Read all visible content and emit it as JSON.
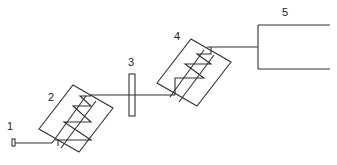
{
  "diagram": {
    "type": "optical-setup schematic",
    "labels": {
      "source": "1",
      "first_block": "2",
      "plate": "3",
      "second_block": "4",
      "output": "5"
    },
    "colors": {
      "line": "#333333",
      "background": "#ffffff"
    }
  }
}
